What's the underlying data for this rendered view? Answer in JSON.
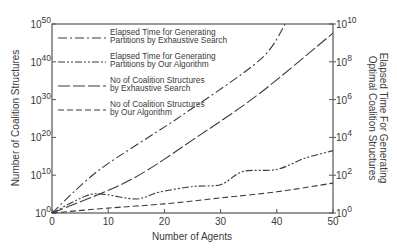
{
  "chart_data": {
    "type": "line",
    "title": "",
    "xlabel": "Number of Agents",
    "ylabel": "Number of Coalition Structures",
    "ylabel_right": "Elapsed Time For Generating Optimal Coalition Structures",
    "xlim": [
      0,
      50
    ],
    "ylim": [
      0,
      50
    ],
    "ylim_right": [
      0,
      10
    ],
    "yscale": "log10 (exponent shown)",
    "grid": false,
    "legend_position": "upper-left",
    "x_ticks": [
      0,
      10,
      20,
      30,
      40,
      50
    ],
    "y_ticks_left": [
      {
        "base": "10",
        "exp": "0",
        "v": 0
      },
      {
        "base": "10",
        "exp": "10",
        "v": 10
      },
      {
        "base": "10",
        "exp": "20",
        "v": 20
      },
      {
        "base": "10",
        "exp": "30",
        "v": 30
      },
      {
        "base": "10",
        "exp": "40",
        "v": 40
      },
      {
        "base": "10",
        "exp": "50",
        "v": 50
      }
    ],
    "y_ticks_right": [
      {
        "base": "10",
        "exp": "0",
        "v": 0
      },
      {
        "base": "10",
        "exp": "2",
        "v": 2
      },
      {
        "base": "10",
        "exp": "4",
        "v": 4
      },
      {
        "base": "10",
        "exp": "6",
        "v": 6
      },
      {
        "base": "10",
        "exp": "8",
        "v": 8
      },
      {
        "base": "10",
        "exp": "10",
        "v": 10
      }
    ],
    "series": [
      {
        "name": "Elapsed Time for Generating Partitions by Exhaustive Search",
        "legend_lines": [
          "Elapsed Time for Generating",
          "Partitions by Exhaustive Search"
        ],
        "axis": "right",
        "dash": "9,3,2,3",
        "x": [
          0,
          8.5,
          22.8,
          37,
          41.5
        ],
        "log10_y": [
          0,
          2.3,
          5.1,
          8.1,
          10
        ]
      },
      {
        "name": "Elapsed Time for Generating Partitions by Our Algorithm",
        "legend_lines": [
          "Elapsed Time for Generating",
          "Partitions by Our Algorithm"
        ],
        "axis": "right",
        "dash": "7,2,2,2,2,2",
        "x": [
          0,
          6,
          9,
          15,
          19,
          25,
          30,
          34,
          40,
          45,
          50
        ],
        "log10_y": [
          0,
          0.9,
          1.0,
          0.74,
          1.1,
          1.4,
          1.5,
          2.2,
          2.3,
          2.9,
          3.3
        ]
      },
      {
        "name": "No of Coalition Structures by Exhaustive Search",
        "legend_lines": [
          "No of Coalition Structures",
          "by Exhaustive Search"
        ],
        "axis": "left",
        "dash": "12,3",
        "x": [
          0,
          13.9,
          26.3,
          37,
          50
        ],
        "log10_y": [
          0,
          8.7,
          20.6,
          31.7,
          47.6
        ]
      },
      {
        "name": "No of Coalition Structures by Our Algorithm",
        "legend_lines": [
          "No of Coalition Structures",
          "by Our Algorithm"
        ],
        "axis": "left",
        "dash": "6,3",
        "x": [
          0,
          10,
          20,
          30,
          40,
          50
        ],
        "log10_y": [
          0,
          1.3,
          2.4,
          4.0,
          5.6,
          7.9
        ]
      }
    ]
  },
  "colors": {
    "axis": "#555555",
    "line": "#3a3a3a",
    "text": "#3a3a3a"
  }
}
